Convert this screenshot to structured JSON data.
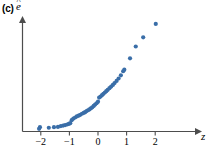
{
  "figure": {
    "panel_label": "(c)",
    "y_axis_label": "e",
    "y_axis_label_accent": "^",
    "x_axis_label": "z"
  },
  "colors": {
    "point": "#3a6ea8",
    "axis": "#4d4d4d",
    "text": "#000000",
    "background": "#ffffff"
  },
  "chart_data": {
    "type": "scatter",
    "title": "(c)",
    "xlabel": "z",
    "ylabel": "e-hat",
    "xlim": [
      -2.45,
      2.45
    ],
    "ylim": [
      0,
      4.2
    ],
    "grid": false,
    "legend": null,
    "xticks": [
      -2,
      -1,
      0,
      1,
      2
    ],
    "xtick_labels": [
      "−2",
      "−1",
      "0",
      "1",
      "2"
    ],
    "yticks": [],
    "ytick_labels": [],
    "annotations": [],
    "series": [
      {
        "name": "residual quantiles",
        "marker": "circle",
        "color": "#3a6ea8",
        "points": [
          [
            -2.06,
            0.1
          ],
          [
            -2.03,
            0.16
          ],
          [
            -1.72,
            0.14
          ],
          [
            -1.54,
            0.16
          ],
          [
            -1.4,
            0.17
          ],
          [
            -1.3,
            0.2
          ],
          [
            -1.22,
            0.22
          ],
          [
            -1.15,
            0.24
          ],
          [
            -1.08,
            0.26
          ],
          [
            -1.02,
            0.28
          ],
          [
            -0.97,
            0.31
          ],
          [
            -0.92,
            0.42
          ],
          [
            -0.86,
            0.48
          ],
          [
            -0.8,
            0.52
          ],
          [
            -0.74,
            0.56
          ],
          [
            -0.68,
            0.59
          ],
          [
            -0.62,
            0.62
          ],
          [
            -0.56,
            0.66
          ],
          [
            -0.5,
            0.69
          ],
          [
            -0.45,
            0.72
          ],
          [
            -0.4,
            0.76
          ],
          [
            -0.35,
            0.79
          ],
          [
            -0.3,
            0.82
          ],
          [
            -0.25,
            0.86
          ],
          [
            -0.2,
            0.9
          ],
          [
            -0.15,
            0.95
          ],
          [
            -0.1,
            1.0
          ],
          [
            -0.05,
            1.05
          ],
          [
            0.0,
            1.11
          ],
          [
            0.04,
            1.26
          ],
          [
            0.09,
            1.3
          ],
          [
            0.14,
            1.35
          ],
          [
            0.19,
            1.4
          ],
          [
            0.24,
            1.45
          ],
          [
            0.29,
            1.5
          ],
          [
            0.34,
            1.55
          ],
          [
            0.4,
            1.61
          ],
          [
            0.46,
            1.67
          ],
          [
            0.52,
            1.73
          ],
          [
            0.58,
            1.8
          ],
          [
            0.65,
            1.88
          ],
          [
            0.72,
            1.97
          ],
          [
            0.8,
            2.09
          ],
          [
            0.88,
            2.24
          ],
          [
            0.92,
            2.3
          ],
          [
            1.12,
            2.72
          ],
          [
            1.32,
            3.16
          ],
          [
            1.58,
            3.5
          ],
          [
            2.02,
            4.0
          ]
        ]
      }
    ]
  }
}
